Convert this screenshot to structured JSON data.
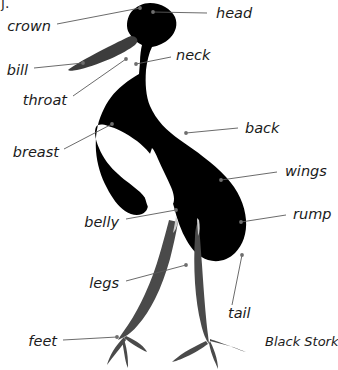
{
  "figure": {
    "caption": "Black Stork",
    "caption_x": 265,
    "caption_y": 341,
    "corner_artifact": "j.",
    "leader_color": "#5a5a5a",
    "dot_color": "#6e6e6e",
    "silhouette_color": "#000000",
    "leg_color": "#4a4a4a",
    "background": "#ffffff",
    "width": 338,
    "height": 370
  },
  "labels": [
    {
      "id": "head",
      "text": "head",
      "text_x": 216,
      "text_y": 13,
      "align": "start",
      "line_x1": 207,
      "line_y1": 13,
      "line_x2": 153,
      "line_y2": 12,
      "dot_x": 153,
      "dot_y": 12
    },
    {
      "id": "crown",
      "text": "crown",
      "text_x": 51,
      "text_y": 26,
      "align": "end",
      "line_x1": 57,
      "line_y1": 24,
      "line_x2": 140,
      "line_y2": 8,
      "dot_x": 140,
      "dot_y": 8
    },
    {
      "id": "neck",
      "text": "neck",
      "text_x": 176,
      "text_y": 55,
      "align": "start",
      "line_x1": 171,
      "line_y1": 57,
      "line_x2": 136,
      "line_y2": 64,
      "dot_x": 136,
      "dot_y": 64
    },
    {
      "id": "bill",
      "text": "bill",
      "text_x": 28,
      "text_y": 70,
      "align": "end",
      "line_x1": 34,
      "line_y1": 68,
      "line_x2": 83,
      "line_y2": 63,
      "dot_x": 83,
      "dot_y": 63
    },
    {
      "id": "throat",
      "text": "throat",
      "text_x": 67,
      "text_y": 100,
      "align": "end",
      "line_x1": 73,
      "line_y1": 96,
      "line_x2": 126,
      "line_y2": 59,
      "dot_x": 126,
      "dot_y": 59
    },
    {
      "id": "back",
      "text": "back",
      "text_x": 245,
      "text_y": 128,
      "align": "start",
      "line_x1": 238,
      "line_y1": 128,
      "line_x2": 186,
      "line_y2": 133,
      "dot_x": 186,
      "dot_y": 133
    },
    {
      "id": "breast",
      "text": "breast",
      "text_x": 59,
      "text_y": 152,
      "align": "end",
      "line_x1": 64,
      "line_y1": 149,
      "line_x2": 112,
      "line_y2": 124,
      "dot_x": 112,
      "dot_y": 124
    },
    {
      "id": "wings",
      "text": "wings",
      "text_x": 285,
      "text_y": 171,
      "align": "start",
      "line_x1": 277,
      "line_y1": 172,
      "line_x2": 221,
      "line_y2": 180,
      "dot_x": 221,
      "dot_y": 180
    },
    {
      "id": "belly",
      "text": "belly",
      "text_x": 119,
      "text_y": 222,
      "align": "end",
      "line_x1": 126,
      "line_y1": 219,
      "line_x2": 176,
      "line_y2": 210,
      "dot_x": 176,
      "dot_y": 210
    },
    {
      "id": "rump",
      "text": "rump",
      "text_x": 293,
      "text_y": 214,
      "align": "start",
      "line_x1": 286,
      "line_y1": 215,
      "line_x2": 241,
      "line_y2": 222,
      "dot_x": 241,
      "dot_y": 222
    },
    {
      "id": "legs",
      "text": "legs",
      "text_x": 119,
      "text_y": 283,
      "align": "end",
      "line_x1": 126,
      "line_y1": 281,
      "line_x2": 186,
      "line_y2": 265,
      "dot_x": 186,
      "dot_y": 265
    },
    {
      "id": "tail",
      "text": "tail",
      "text_x": 228,
      "text_y": 313,
      "align": "start",
      "line_x1": 232,
      "line_y1": 305,
      "line_x2": 242,
      "line_y2": 255,
      "dot_x": 242,
      "dot_y": 255
    },
    {
      "id": "feet",
      "text": "feet",
      "text_x": 57,
      "text_y": 341,
      "align": "end",
      "line_x1": 63,
      "line_y1": 340,
      "line_x2": 117,
      "line_y2": 337,
      "dot_x": 117,
      "dot_y": 337
    }
  ],
  "bird": {
    "name": "black-stork-silhouette",
    "body_path": "M150,3 C161,3 171,9 175,17 C178,24 176,32 170,38 C165,43 158,46 152,47 C149,53 147,61 146,70 C145,84 146,96 150,106 C156,120 167,131 180,140 C196,151 213,163 226,177 C238,190 245,205 246,220 C247,233 243,245 235,253 C228,260 218,263 208,260 C199,257 192,250 187,241 C181,231 177,219 174,207 C170,193 166,180 160,169 C154,157 146,148 137,141 C126,133 116,128 108,126 C102,124 98,124 96,127 C94,131 95,139 99,148 C103,158 110,167 118,174 C122,178 126,181 129,183 L140,192 C144,196 147,200 148,204 C148,209 146,212 142,214 C137,216 131,215 125,211 C118,206 112,198 107,188 C101,177 97,164 96,151 C95,137 97,124 102,113 C107,101 114,92 123,85 C129,80 134,77 139,74 L140,62 C140,55 141,49 142,45 C136,42 131,37 128,31 C126,25 127,17 132,11 C137,6 143,3 150,3 Z",
    "bill_path": "M131,36 C126,38 118,42 108,47 C96,53 85,59 77,64 C72,67 69,69 68,70 C69,71 72,71 77,70 C86,68 98,64 110,59 C121,54 130,49 135,45 C137,43 138,41 137,39 C136,37 134,36 131,36 Z",
    "belly_patch_path": "M152,148 C149,155 148,163 148,171 C148,180 150,188 153,195 C156,201 160,205 164,207 C168,208 171,207 173,204 C175,200 174,194 171,187 C167,178 162,168 158,159 C156,154 154,150 152,148 Z",
    "white_flank_path": "M150,160 C146,170 144,181 144,191 C145,201 148,209 153,214 C157,218 161,219 164,217 C166,214 165,209 162,202 C158,192 154,180 151,169 Z",
    "leg_left_path": "M178,222 C176,234 173,247 170,259 C166,273 161,287 155,299 C150,309 144,318 138,325 C133,331 128,335 124,337 L118,340 C120,336 124,331 128,325 C134,316 140,305 145,294 C151,281 156,267 160,253 C164,239 167,228 169,220 Z",
    "leg_right_path": "M199,225 C200,238 201,252 202,265 C203,280 204,294 205,306 C206,318 207,328 208,335 L209,344 C206,340 203,333 201,324 C198,312 196,298 195,283 C194,267 194,251 195,237 C195,231 196,227 197,224 Z",
    "foot_left_path": "M124,337 C120,341 116,346 113,351 C110,356 108,361 107,365 C109,362 113,357 117,352 C121,347 124,343 126,340 Z M122,340 C123,346 124,352 125,358 C126,363 127,366 128,368 C128,364 128,358 127,352 C126,346 125,342 124,339 Z M126,336 C131,338 136,341 140,344 C144,347 146,350 147,352 C144,351 139,348 134,345 C129,342 126,339 124,338 Z",
    "foot_right_path": "M206,341 C199,344 192,348 185,352 C179,356 175,359 172,362 C177,361 184,358 192,354 C200,350 205,346 208,344 Z M209,343 C210,349 212,355 214,360 C216,364 217,367 218,369 C218,365 217,359 215,353 C213,347 211,343 210,341 Z M210,341 C218,343 226,345 233,347 C239,349 243,351 246,352 C242,351 235,348 227,345 C219,342 213,340 210,339 Z",
    "tarsus_left_light_path": "M176,216 C175,222 174,228 173,233 C175,231 177,227 178,222 Z",
    "tarsus_right_light_path": "M197,218 C197,224 198,230 198,236 C200,232 200,226 199,220 Z"
  }
}
